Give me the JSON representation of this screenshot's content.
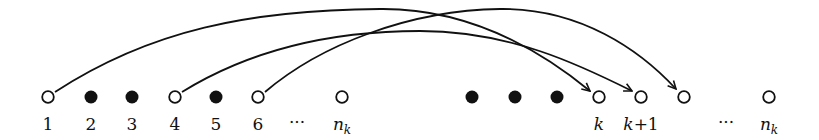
{
  "diagram": {
    "colors": {
      "stroke": "#111111",
      "fill_filled": "#111111",
      "fill_open": "#ffffff",
      "background": "#ffffff"
    },
    "nodes": [
      {
        "id": "n1",
        "x": 48,
        "filled": false,
        "label": "1"
      },
      {
        "id": "n2",
        "x": 91,
        "filled": true,
        "label": "2"
      },
      {
        "id": "n3",
        "x": 132,
        "filled": true,
        "label": "3"
      },
      {
        "id": "n4",
        "x": 175,
        "filled": false,
        "label": "4"
      },
      {
        "id": "n5",
        "x": 216,
        "filled": true,
        "label": "5"
      },
      {
        "id": "n6",
        "x": 258,
        "filled": false,
        "label": "6"
      },
      {
        "id": "nk_left",
        "x": 342,
        "filled": false,
        "label": "n",
        "label_sub": "k"
      },
      {
        "id": "f1",
        "x": 472,
        "filled": true,
        "label": ""
      },
      {
        "id": "f2",
        "x": 515,
        "filled": true,
        "label": ""
      },
      {
        "id": "f3",
        "x": 557,
        "filled": true,
        "label": ""
      },
      {
        "id": "k",
        "x": 599,
        "filled": false,
        "label": "k"
      },
      {
        "id": "k1",
        "x": 641,
        "filled": false,
        "label": "k+1"
      },
      {
        "id": "k2",
        "x": 684,
        "filled": false,
        "label": ""
      },
      {
        "id": "nk_right",
        "x": 769,
        "filled": false,
        "label": "n",
        "label_sub": "k"
      }
    ],
    "ellipses": [
      {
        "x": 297,
        "text": "···"
      },
      {
        "x": 726,
        "text": "···"
      }
    ],
    "arcs": [
      {
        "from": "n1",
        "to": "k"
      },
      {
        "from": "n4",
        "to": "k1"
      },
      {
        "from": "n6",
        "to": "k2"
      }
    ]
  }
}
